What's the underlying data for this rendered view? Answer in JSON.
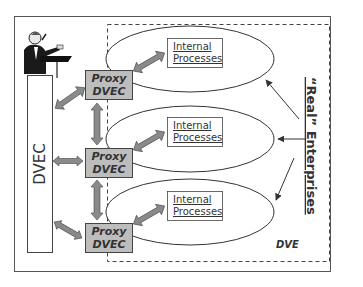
{
  "diagram": {
    "dvec_label": "DVEC",
    "proxies": [
      {
        "line1": "Proxy",
        "line2": "DVEC"
      },
      {
        "line1": "Proxy",
        "line2": "DVEC"
      },
      {
        "line1": "Proxy",
        "line2": "DVEC"
      }
    ],
    "processes": [
      {
        "line1": "Internal",
        "line2": "Processes"
      },
      {
        "line1": "Internal",
        "line2": "Processes"
      },
      {
        "line1": "Internal",
        "line2": "Processes"
      }
    ],
    "real_enterprises_label": "“Real” Enterprises",
    "dve_label": "DVE",
    "presenter_icon": "speaker-at-podium-icon",
    "colors": {
      "proxy_fill": "#bdbdbd",
      "arrow_fill": "#8a8a8a",
      "line": "#333333",
      "background": "#ffffff"
    }
  }
}
